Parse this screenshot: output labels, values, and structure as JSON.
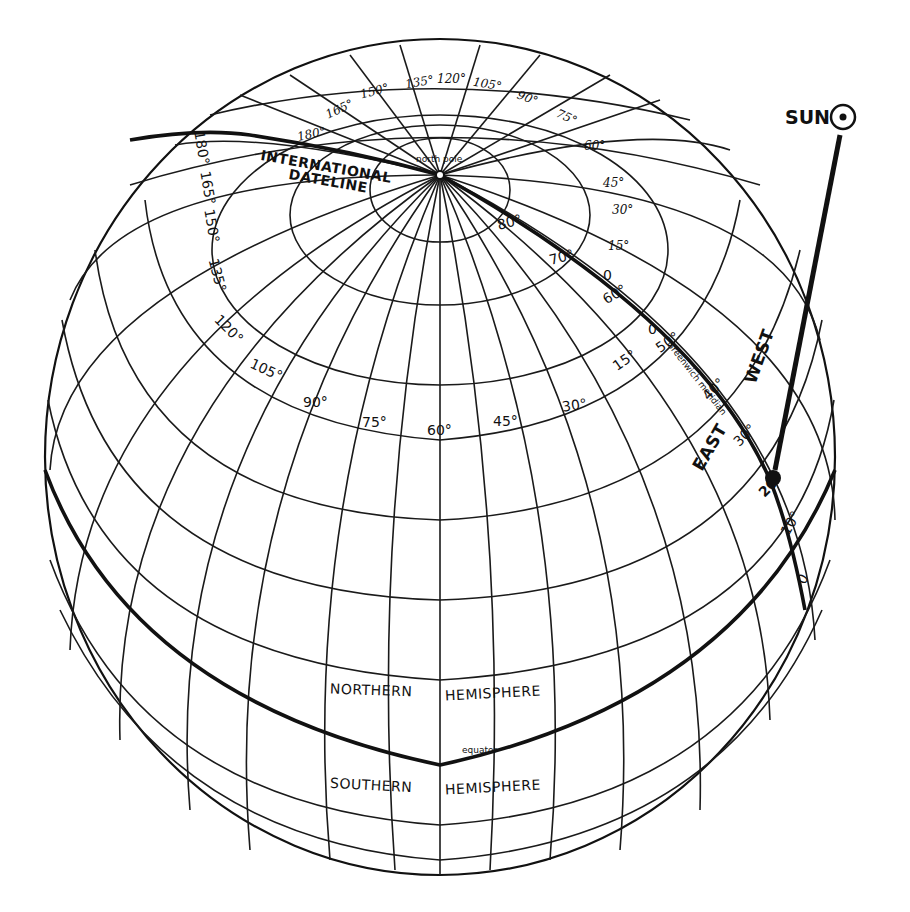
{
  "diagram": {
    "sun": {
      "label": "SUN",
      "symbol": "☉"
    },
    "pole_label": "north pole",
    "dateline_label_1": "INTERNATIONAL",
    "dateline_label_2": "DATELINE",
    "greenwich_label": "Greenwich meridian",
    "east_label": "EAST",
    "west_label": "WEST",
    "equator_label": "equator",
    "northern_label_1": "NORTHERN",
    "northern_label_2": "HEMISPHERE",
    "southern_label_1": "SOUTHERN",
    "southern_label_2": "HEMISPHERE",
    "longitude_labels_upper": [
      "180°",
      "165°",
      "150°",
      "135°",
      "120°",
      "105°",
      "90°",
      "75°",
      "60°",
      "45°",
      "30°",
      "15°"
    ],
    "longitude_labels_lower": [
      "165°",
      "150°",
      "135°",
      "120°",
      "105°",
      "90°",
      "75°",
      "60°",
      "45°",
      "30°",
      "15°"
    ],
    "dateline_lon_label": "180°",
    "latitude_labels_greenwich": [
      "80°",
      "70°",
      "60°",
      "50°",
      "40°",
      "30°",
      "20°",
      "10°",
      "0"
    ],
    "greenwich_zero_1": "0",
    "greenwich_zero_2": "0"
  }
}
